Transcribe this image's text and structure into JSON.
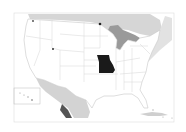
{
  "map": {
    "title": "Locator map of the United States",
    "highlighted_state": "Missouri",
    "colors": {
      "background": "#ffffff",
      "frame": "#d8d8d8",
      "land": "#ffffff",
      "state_border": "#d0d0d0",
      "water": "#c8c8c8",
      "highlight": "#1a1a1a"
    }
  }
}
